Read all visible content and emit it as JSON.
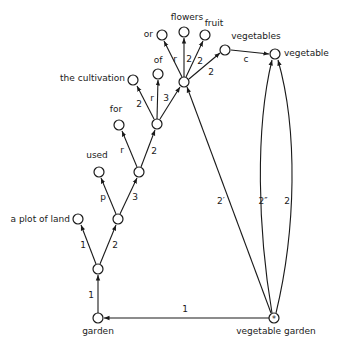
{
  "diagram": {
    "type": "semantic-network",
    "root": "vegetable garden",
    "nodes": [
      {
        "id": "garden",
        "label": "garden",
        "x": 98,
        "y": 318,
        "label_pos": "below"
      },
      {
        "id": "n1",
        "label": "",
        "x": 98,
        "y": 269
      },
      {
        "id": "plot",
        "label": "a plot of land",
        "x": 78,
        "y": 219,
        "label_pos": "left"
      },
      {
        "id": "n2",
        "label": "",
        "x": 118,
        "y": 219
      },
      {
        "id": "used",
        "label": "used",
        "x": 99,
        "y": 172,
        "label_pos": "above"
      },
      {
        "id": "n3",
        "label": "",
        "x": 139,
        "y": 172
      },
      {
        "id": "for",
        "label": "for",
        "x": 119,
        "y": 125,
        "label_pos": "above"
      },
      {
        "id": "n4",
        "label": "",
        "x": 157,
        "y": 124
      },
      {
        "id": "cultivation",
        "label": "the cultivation",
        "x": 133,
        "y": 80,
        "label_pos": "left"
      },
      {
        "id": "of",
        "label": "of",
        "x": 158,
        "y": 74,
        "label_pos": "above"
      },
      {
        "id": "hub",
        "label": "",
        "x": 184,
        "y": 82
      },
      {
        "id": "or",
        "label": "or",
        "x": 162,
        "y": 35,
        "label_pos": "left"
      },
      {
        "id": "flowers",
        "label": "flowers",
        "x": 184,
        "y": 32,
        "label_pos": "above"
      },
      {
        "id": "fruit",
        "label": "fruit",
        "x": 205,
        "y": 35,
        "label_pos": "above"
      },
      {
        "id": "vegetables",
        "label": "vegetables",
        "x": 225,
        "y": 50,
        "label_pos": "above"
      },
      {
        "id": "vegetable",
        "label": "vegetable",
        "x": 275,
        "y": 54,
        "label_pos": "right"
      },
      {
        "id": "vg",
        "label": "vegetable garden",
        "x": 274,
        "y": 318,
        "label_pos": "below",
        "marker": "*"
      }
    ],
    "edges": [
      {
        "from": "vg",
        "to": "garden",
        "label": "1"
      },
      {
        "from": "garden",
        "to": "n1",
        "label": "1"
      },
      {
        "from": "n1",
        "to": "plot",
        "label": "1"
      },
      {
        "from": "n1",
        "to": "n2",
        "label": "2"
      },
      {
        "from": "n2",
        "to": "used",
        "label": "p"
      },
      {
        "from": "n2",
        "to": "n3",
        "label": "3"
      },
      {
        "from": "n3",
        "to": "for",
        "label": "r"
      },
      {
        "from": "n3",
        "to": "n4",
        "label": "2"
      },
      {
        "from": "n4",
        "to": "cultivation",
        "label": "2"
      },
      {
        "from": "n4",
        "to": "of",
        "label": "r"
      },
      {
        "from": "n4",
        "to": "hub",
        "label": "3"
      },
      {
        "from": "hub",
        "to": "or",
        "label": "r"
      },
      {
        "from": "hub",
        "to": "flowers",
        "label": "2"
      },
      {
        "from": "hub",
        "to": "fruit",
        "label": "2"
      },
      {
        "from": "hub",
        "to": "vegetables",
        "label": "2"
      },
      {
        "from": "vegetables",
        "to": "vegetable",
        "label": "c"
      },
      {
        "from": "vg",
        "to": "hub",
        "label": "2′"
      },
      {
        "from": "vg",
        "to": "vegetable",
        "label": "2″",
        "curved": true
      },
      {
        "from": "vg",
        "to": "vegetable",
        "label": "2",
        "curved": true
      }
    ],
    "node_labels": {
      "garden": "garden",
      "plot": "a plot of land",
      "used": "used",
      "for": "for",
      "cultivation": "the cultivation",
      "of": "of",
      "or": "or",
      "flowers": "flowers",
      "fruit": "fruit",
      "vegetables": "vegetables",
      "vegetable": "vegetable",
      "vg": "vegetable garden",
      "vg_marker": "*"
    },
    "edge_labels": {
      "vg_garden": "1",
      "garden_n1": "1",
      "n1_plot": "1",
      "n1_n2": "2",
      "n2_used": "p",
      "n2_n3": "3",
      "n3_for": "r",
      "n3_n4": "2",
      "n4_cult": "2",
      "n4_of": "r",
      "n4_hub": "3",
      "hub_or": "r",
      "hub_flowers": "2",
      "hub_fruit": "2",
      "hub_vegetables": "2",
      "vegetables_vegetable": "c",
      "vg_hub": "2′",
      "vg_veg_inner": "2″",
      "vg_veg_outer": "2"
    },
    "colors": {
      "ink": "#1a1a1a",
      "background": "#ffffff"
    }
  }
}
